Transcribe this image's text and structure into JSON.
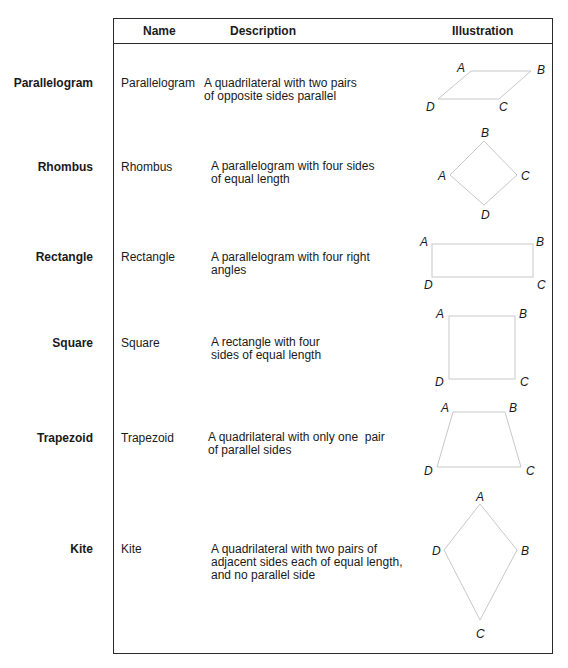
{
  "table": {
    "headers": {
      "name": "Name",
      "description": "Description",
      "illustration": "Illustration"
    },
    "rows": [
      {
        "side_label": "Parallelogram",
        "name": "Parallelogram",
        "description": [
          "A quadrilateral with two pairs",
          "of opposite sides parallel"
        ],
        "vertices": [
          "A",
          "B",
          "C",
          "D"
        ]
      },
      {
        "side_label": "Rhombus",
        "name": "Rhombus",
        "description": [
          "A parallelogram with four sides",
          "of equal length"
        ],
        "vertices": [
          "B",
          "A",
          "C",
          "D"
        ]
      },
      {
        "side_label": "Rectangle",
        "name": "Rectangle",
        "description": [
          "A parallelogram with four right",
          "angles"
        ],
        "vertices": [
          "A",
          "B",
          "D",
          "C"
        ]
      },
      {
        "side_label": "Square",
        "name": "Square",
        "description": [
          "A rectangle with four",
          "sides of equal length"
        ],
        "vertices": [
          "A",
          "B",
          "D",
          "C"
        ]
      },
      {
        "side_label": "Trapezoid",
        "name": "Trapezoid",
        "description": [
          "A quadrilateral with only one  pair",
          "of parallel sides"
        ],
        "vertices": [
          "A",
          "B",
          "D",
          "C"
        ]
      },
      {
        "side_label": "Kite",
        "name": "Kite",
        "description": [
          "A quadrilateral with two pairs of",
          "adjacent sides each of equal length,",
          "and no parallel side"
        ],
        "vertices": [
          "A",
          "D",
          "B",
          "C"
        ]
      }
    ]
  },
  "colors": {
    "border": "#2a2a2a",
    "shape_stroke": "#c8c8c8",
    "text": "#1a1a1a"
  }
}
